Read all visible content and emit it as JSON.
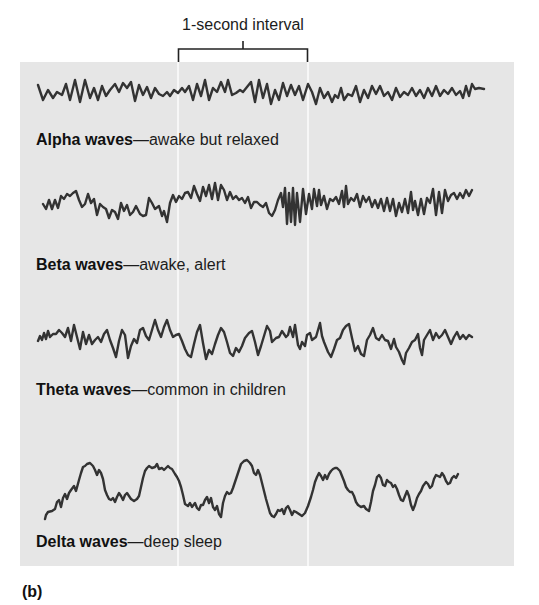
{
  "figure": {
    "panel_letter": "(b)",
    "interval_label": "1-second interval",
    "colors": {
      "panel_background": "#e6e6e6",
      "trace": "#333333",
      "divider": "#f7f7f7"
    }
  },
  "waves": [
    {
      "name": "Alpha waves",
      "description": "—awake but relaxed"
    },
    {
      "name": "Beta waves",
      "description": "—awake, alert"
    },
    {
      "name": "Theta waves",
      "description": "—common in children"
    },
    {
      "name": "Delta waves",
      "description": "—deep sleep"
    }
  ]
}
